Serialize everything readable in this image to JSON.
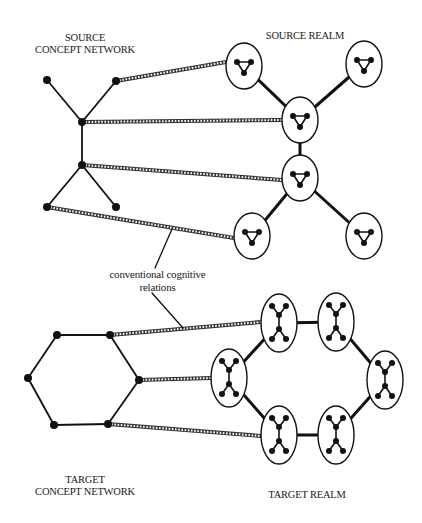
{
  "labels": {
    "source_network": [
      "SOURCE",
      "CONCEPT NETWORK"
    ],
    "source_realm": "SOURCE REALM",
    "relations": [
      "conventional cognitive",
      "relations"
    ],
    "target_network": [
      "TARGET",
      "CONCEPT NETWORK"
    ],
    "target_realm": "TARGET REALM"
  },
  "colors": {
    "ink": "#111111",
    "background": "#ffffff"
  },
  "source_network": {
    "nodes": [
      [
        47,
        80
      ],
      [
        116,
        81
      ],
      [
        82,
        122
      ],
      [
        82,
        165
      ],
      [
        47,
        207
      ],
      [
        116,
        207
      ]
    ],
    "edges": [
      [
        0,
        2
      ],
      [
        1,
        2
      ],
      [
        2,
        3
      ],
      [
        3,
        4
      ],
      [
        3,
        5
      ]
    ]
  },
  "source_realm": {
    "ellipses": [
      [
        244,
        66
      ],
      [
        364,
        64
      ],
      [
        300,
        120
      ],
      [
        300,
        178
      ],
      [
        252,
        236
      ],
      [
        364,
        236
      ]
    ],
    "rx": 18,
    "ry": 23,
    "edges": [
      [
        0,
        2
      ],
      [
        1,
        2
      ],
      [
        2,
        3
      ],
      [
        3,
        4
      ],
      [
        3,
        5
      ]
    ],
    "glyph": "triangle"
  },
  "target_network": {
    "nodes": [
      [
        57,
        335
      ],
      [
        110,
        335
      ],
      [
        139,
        380
      ],
      [
        108,
        424
      ],
      [
        54,
        425
      ],
      [
        28,
        378
      ]
    ],
    "edges": [
      [
        0,
        1
      ],
      [
        1,
        2
      ],
      [
        2,
        3
      ],
      [
        3,
        4
      ],
      [
        4,
        5
      ],
      [
        5,
        0
      ]
    ]
  },
  "target_realm": {
    "ellipses": [
      [
        279,
        323
      ],
      [
        336,
        322
      ],
      [
        385,
        380
      ],
      [
        336,
        435
      ],
      [
        279,
        435
      ],
      [
        229,
        378
      ]
    ],
    "rx": 18,
    "ry": 29,
    "edges": [
      [
        0,
        1
      ],
      [
        1,
        2
      ],
      [
        2,
        3
      ],
      [
        3,
        4
      ],
      [
        4,
        5
      ],
      [
        5,
        0
      ]
    ],
    "glyph": "x-cluster"
  },
  "mappings": [
    {
      "from": [
        116,
        81
      ],
      "to": [
        226,
        62
      ]
    },
    {
      "from": [
        82,
        122
      ],
      "to": [
        282,
        120
      ]
    },
    {
      "from": [
        82,
        165
      ],
      "to": [
        282,
        180
      ]
    },
    {
      "from": [
        47,
        207
      ],
      "to": [
        234,
        238
      ]
    },
    {
      "from": [
        110,
        335
      ],
      "to": [
        261,
        322
      ]
    },
    {
      "from": [
        139,
        380
      ],
      "to": [
        211,
        378
      ]
    },
    {
      "from": [
        108,
        424
      ],
      "to": [
        261,
        436
      ]
    }
  ],
  "leaders": [
    {
      "from": [
        155,
        268
      ],
      "to": [
        172,
        229
      ]
    },
    {
      "from": [
        152,
        293
      ],
      "to": [
        183,
        328
      ]
    }
  ]
}
